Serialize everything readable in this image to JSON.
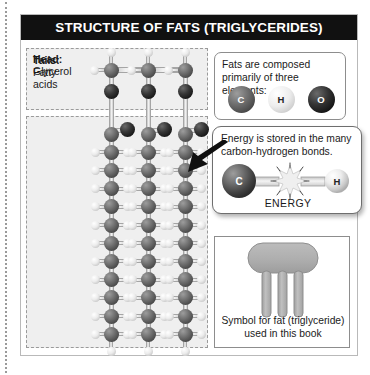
{
  "figure": {
    "title": "STRUCTURE OF FATS (TRIGLYCERIDES)",
    "title_bg": "#111111",
    "title_color": "#ffffff"
  },
  "molecule": {
    "head": {
      "label_strong": "Head:",
      "label_normal": "Glycerol",
      "carbon_count": 3,
      "oxygen_count": 3
    },
    "tails": {
      "label_strong": "Tails:",
      "label_normal_line1": "Fatty",
      "label_normal_line2": "acids",
      "chain_count": 3,
      "carbons_per_chain": 12
    }
  },
  "elements_box": {
    "text": "Fats are composed primarily of three elements:",
    "elements": [
      {
        "symbol": "C",
        "name": "carbon",
        "color": "#5a5a5a"
      },
      {
        "symbol": "H",
        "name": "hydrogen",
        "color": "#e4e4e4"
      },
      {
        "symbol": "O",
        "name": "oxygen",
        "color": "#121212"
      }
    ]
  },
  "energy_box": {
    "text": "Energy is stored in the many carbon-hydrogen bonds.",
    "atom_left": "C",
    "atom_right": "H",
    "label": "ENERGY"
  },
  "symbol_box": {
    "caption_line1": "Symbol for fat (triglyceride)",
    "caption_line2": "used in this book",
    "tail_count": 3,
    "fill": "#adadad"
  }
}
